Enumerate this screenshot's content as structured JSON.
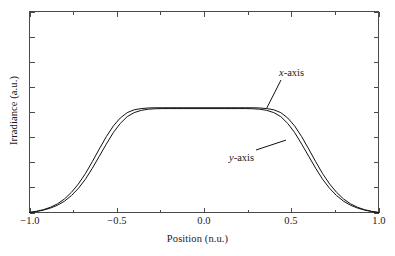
{
  "chart_data": {
    "type": "line",
    "title": "",
    "xlabel": "Position (n.u.)",
    "ylabel": "Irradiance (a.u.)",
    "xlim": [
      -1.0,
      1.0
    ],
    "ylim": [
      0.0,
      1.0
    ],
    "grid": false,
    "legend_position": "inline-annotations",
    "x_major_ticks": [
      -1.0,
      -0.5,
      0.0,
      0.5,
      1.0
    ],
    "x_major_tick_labels": [
      "−1.0",
      "−0.5",
      "0.0",
      "0.5",
      "1.0"
    ],
    "x_minor_ticks": [
      -0.75,
      -0.25,
      0.25,
      0.75
    ],
    "y_major_ticks": [
      0.0,
      0.125,
      0.25,
      0.375,
      0.5,
      0.625,
      0.75,
      0.875,
      1.0
    ],
    "y_major_tick_labels": [
      "",
      "",
      "",
      "",
      "",
      "",
      "",
      "",
      ""
    ],
    "plateau_level": 0.52,
    "annotations": [
      {
        "id": "x-axis-callout",
        "var": "x",
        "rest": "-axis",
        "points_to": [
          0.36,
          0.52
        ]
      },
      {
        "id": "y-axis-callout",
        "var": "y",
        "rest": "-axis",
        "points_to": [
          0.47,
          0.36
        ]
      }
    ],
    "series": [
      {
        "name": "x-axis",
        "description": "Flat-top super-Gaussian irradiance profile along the x-axis; slightly wider shoulders than the y-axis profile.",
        "color": "#111111",
        "x": [
          -1.0,
          -0.96,
          -0.92,
          -0.88,
          -0.84,
          -0.8,
          -0.76,
          -0.72,
          -0.68,
          -0.64,
          -0.6,
          -0.56,
          -0.52,
          -0.48,
          -0.44,
          -0.4,
          -0.36,
          -0.32,
          -0.28,
          -0.24,
          -0.2,
          -0.16,
          -0.12,
          -0.08,
          -0.04,
          0.0,
          0.04,
          0.08,
          0.12,
          0.16,
          0.2,
          0.24,
          0.28,
          0.32,
          0.36,
          0.4,
          0.44,
          0.48,
          0.52,
          0.56,
          0.6,
          0.64,
          0.68,
          0.72,
          0.76,
          0.8,
          0.84,
          0.88,
          0.92,
          0.96,
          1.0
        ],
        "y": [
          0.0,
          0.006,
          0.014,
          0.026,
          0.043,
          0.067,
          0.1,
          0.142,
          0.193,
          0.253,
          0.316,
          0.377,
          0.43,
          0.47,
          0.497,
          0.511,
          0.517,
          0.52,
          0.521,
          0.521,
          0.521,
          0.521,
          0.521,
          0.521,
          0.521,
          0.521,
          0.521,
          0.521,
          0.521,
          0.521,
          0.521,
          0.521,
          0.521,
          0.52,
          0.517,
          0.511,
          0.497,
          0.47,
          0.43,
          0.377,
          0.316,
          0.253,
          0.193,
          0.142,
          0.1,
          0.067,
          0.043,
          0.026,
          0.014,
          0.006,
          0.0
        ]
      },
      {
        "name": "y-axis",
        "description": "Flat-top super-Gaussian irradiance profile along the y-axis; marginally narrower than the x-axis profile.",
        "color": "#111111",
        "x": [
          -1.0,
          -0.96,
          -0.92,
          -0.88,
          -0.84,
          -0.8,
          -0.76,
          -0.72,
          -0.68,
          -0.64,
          -0.6,
          -0.56,
          -0.52,
          -0.48,
          -0.44,
          -0.4,
          -0.36,
          -0.32,
          -0.28,
          -0.24,
          -0.2,
          -0.16,
          -0.12,
          -0.08,
          -0.04,
          0.0,
          0.04,
          0.08,
          0.12,
          0.16,
          0.2,
          0.24,
          0.28,
          0.32,
          0.36,
          0.4,
          0.44,
          0.48,
          0.52,
          0.56,
          0.6,
          0.64,
          0.68,
          0.72,
          0.76,
          0.8,
          0.84,
          0.88,
          0.92,
          0.96,
          1.0
        ],
        "y": [
          0.0,
          0.005,
          0.012,
          0.022,
          0.036,
          0.056,
          0.084,
          0.12,
          0.165,
          0.22,
          0.28,
          0.34,
          0.397,
          0.443,
          0.477,
          0.497,
          0.508,
          0.514,
          0.516,
          0.517,
          0.517,
          0.517,
          0.517,
          0.517,
          0.517,
          0.517,
          0.517,
          0.517,
          0.517,
          0.517,
          0.517,
          0.517,
          0.516,
          0.514,
          0.508,
          0.497,
          0.477,
          0.443,
          0.397,
          0.34,
          0.28,
          0.22,
          0.165,
          0.12,
          0.084,
          0.056,
          0.036,
          0.022,
          0.012,
          0.005,
          0.0
        ]
      }
    ]
  },
  "axes": {
    "x_title": "Position (n.u.)",
    "y_title": "Irradiance (a.u.)",
    "x_tick_labels": [
      "−1.0",
      "−0.5",
      "0.0",
      "0.5",
      "1.0"
    ]
  },
  "annotations": {
    "x_callout": {
      "var": "x",
      "suffix": "-axis"
    },
    "y_callout": {
      "var": "y",
      "suffix": "-axis"
    }
  },
  "colors": {
    "curve": "#111111",
    "frame": "#4a4a4a",
    "text": "#1a1a1a",
    "background": "#ffffff"
  }
}
